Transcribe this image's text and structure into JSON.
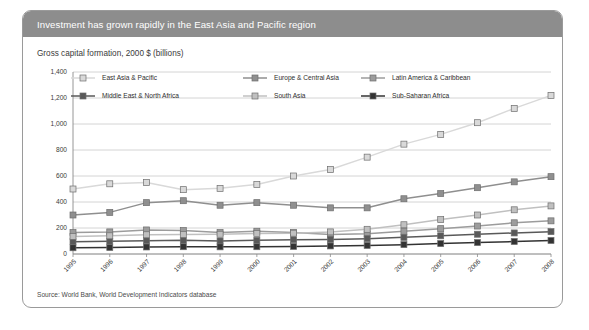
{
  "header": {
    "title": "Investment has grown rapidly in the East Asia and Pacific region"
  },
  "subtitle": "Gross capital formation, 2000 $ (billions)",
  "source": "Source: World Bank, World Development Indicators database",
  "colors": {
    "header_bg": "#8d8d8d",
    "header_text": "#ffffff",
    "card_border": "#9a9a9a",
    "grid": "#c9c9c9",
    "axis": "#8a8a8a",
    "east_asia_pacific": "#d9d9d9",
    "europe_central_asia": "#8f8f8f",
    "latin_america_caribbean": "#9c9c9c",
    "middle_east_north_africa": "#595959",
    "south_asia": "#c0c0c0",
    "sub_saharan_africa": "#333333"
  },
  "chart_data": {
    "type": "line",
    "title": "Investment has grown rapidly in the East Asia and Pacific region",
    "subtitle": "Gross capital formation, 2000 $ (billions)",
    "xlabel": "",
    "ylabel": "Gross capital formation, 2000 $ (billions)",
    "ylim": [
      0,
      1400
    ],
    "ytick_step": 200,
    "grid": true,
    "legend_position": "top-inside",
    "categories": [
      "1995",
      "1996",
      "1997",
      "1998",
      "1999",
      "2000",
      "2001",
      "2002",
      "2003",
      "2004",
      "2005",
      "2006",
      "2007",
      "2008"
    ],
    "ytick_labels": [
      "0",
      "200",
      "400",
      "600",
      "800",
      "1,000",
      "1,200",
      "1,400"
    ],
    "series": [
      {
        "name": "East Asia & Pacific",
        "color": "#d9d9d9",
        "values": [
          500,
          540,
          550,
          495,
          505,
          535,
          600,
          650,
          745,
          845,
          920,
          1010,
          1120,
          1220
        ]
      },
      {
        "name": "Europe & Central Asia",
        "color": "#8f8f8f",
        "values": [
          300,
          320,
          395,
          410,
          375,
          395,
          375,
          355,
          355,
          425,
          465,
          510,
          555,
          595
        ]
      },
      {
        "name": "Latin America & Caribbean",
        "color": "#9c9c9c",
        "values": [
          165,
          170,
          185,
          180,
          165,
          175,
          165,
          150,
          155,
          175,
          195,
          215,
          240,
          255
        ]
      },
      {
        "name": "Middle East & North Africa",
        "color": "#595959",
        "values": [
          95,
          98,
          102,
          105,
          100,
          105,
          110,
          112,
          118,
          128,
          140,
          152,
          162,
          172
        ]
      },
      {
        "name": "South Asia",
        "color": "#c0c0c0",
        "values": [
          135,
          140,
          148,
          150,
          152,
          158,
          160,
          170,
          190,
          225,
          265,
          300,
          340,
          370
        ]
      },
      {
        "name": "Sub-Saharan Africa",
        "color": "#333333",
        "values": [
          48,
          50,
          54,
          56,
          55,
          56,
          58,
          62,
          66,
          72,
          80,
          88,
          96,
          104
        ]
      }
    ],
    "legend": [
      {
        "label": "East Asia & Pacific",
        "color": "#d9d9d9"
      },
      {
        "label": "Europe & Central Asia",
        "color": "#8f8f8f"
      },
      {
        "label": "Latin America & Caribbean",
        "color": "#9c9c9c"
      },
      {
        "label": "Middle East & North Africa",
        "color": "#595959"
      },
      {
        "label": "South Asia",
        "color": "#c0c0c0"
      },
      {
        "label": "Sub-Saharan Africa",
        "color": "#333333"
      }
    ]
  }
}
